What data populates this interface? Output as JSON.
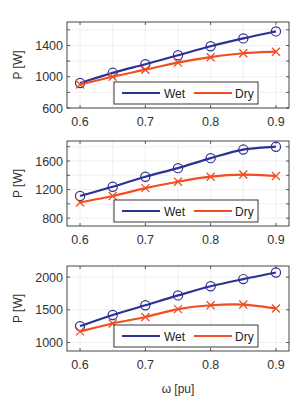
{
  "figure": {
    "xlabel": "ω [pu]",
    "colors": {
      "wet": "#2e3192",
      "dry": "#f04e23",
      "grid": "#e6e6e6",
      "axis": "#333333"
    }
  },
  "chart_data": [
    {
      "type": "line",
      "title": "",
      "xlabel": "",
      "ylabel": "P [W]",
      "x": [
        0.6,
        0.65,
        0.7,
        0.75,
        0.8,
        0.85,
        0.9
      ],
      "xlim": [
        0.58,
        0.92
      ],
      "ylim": [
        600,
        1700
      ],
      "xticks": [
        0.6,
        0.7,
        0.8,
        0.9
      ],
      "xtick_labels": [
        "0.6",
        "0.7",
        "0.8",
        "0.9"
      ],
      "yticks": [
        600,
        1000,
        1400
      ],
      "ytick_labels": [
        "600",
        "1000",
        "1400"
      ],
      "yminor_ticks": [
        800,
        1200,
        1600
      ],
      "grid": true,
      "legend_position": "lower right",
      "series": [
        {
          "name": "Wet",
          "marker": "o",
          "color": "#2e3192",
          "values": [
            920,
            1050,
            1160,
            1275,
            1390,
            1490,
            1580
          ]
        },
        {
          "name": "Dry",
          "marker": "x",
          "color": "#f04e23",
          "values": [
            900,
            1000,
            1090,
            1180,
            1250,
            1300,
            1320
          ]
        }
      ]
    },
    {
      "type": "line",
      "title": "",
      "xlabel": "",
      "ylabel": "P [W]",
      "x": [
        0.6,
        0.65,
        0.7,
        0.75,
        0.8,
        0.85,
        0.9
      ],
      "xlim": [
        0.58,
        0.92
      ],
      "ylim": [
        690,
        1880
      ],
      "xticks": [
        0.6,
        0.7,
        0.8,
        0.9
      ],
      "xtick_labels": [
        "0.6",
        "0.7",
        "0.8",
        "0.9"
      ],
      "yticks": [
        800,
        1200,
        1600
      ],
      "ytick_labels": [
        "800",
        "1200",
        "1600"
      ],
      "yminor_ticks": [
        1000,
        1400,
        1800
      ],
      "grid": true,
      "legend_position": "lower right",
      "series": [
        {
          "name": "Wet",
          "marker": "o",
          "color": "#2e3192",
          "values": [
            1110,
            1240,
            1380,
            1500,
            1640,
            1760,
            1800
          ]
        },
        {
          "name": "Dry",
          "marker": "x",
          "color": "#f04e23",
          "values": [
            1020,
            1110,
            1220,
            1310,
            1380,
            1410,
            1390
          ]
        }
      ]
    },
    {
      "type": "line",
      "title": "",
      "xlabel": "ω [pu]",
      "ylabel": "P [W]",
      "x": [
        0.6,
        0.65,
        0.7,
        0.75,
        0.8,
        0.85,
        0.9
      ],
      "xlim": [
        0.58,
        0.92
      ],
      "ylim": [
        870,
        2170
      ],
      "xticks": [
        0.6,
        0.7,
        0.8,
        0.9
      ],
      "xtick_labels": [
        "0.6",
        "0.7",
        "0.8",
        "0.9"
      ],
      "yticks": [
        1000,
        1500,
        2000
      ],
      "ytick_labels": [
        "1000",
        "1500",
        "2000"
      ],
      "yminor_ticks": [],
      "grid": true,
      "legend_position": "lower right",
      "series": [
        {
          "name": "Wet",
          "marker": "o",
          "color": "#2e3192",
          "values": [
            1250,
            1420,
            1570,
            1720,
            1860,
            1970,
            2070
          ]
        },
        {
          "name": "Dry",
          "marker": "x",
          "color": "#f04e23",
          "values": [
            1170,
            1290,
            1390,
            1510,
            1570,
            1580,
            1520
          ]
        }
      ]
    }
  ],
  "panels": [
    {
      "ylabel": "P [W]",
      "legend": {
        "wet": "Wet",
        "dry": "Dry"
      }
    },
    {
      "ylabel": "P [W]",
      "legend": {
        "wet": "Wet",
        "dry": "Dry"
      }
    },
    {
      "ylabel": "P [W]",
      "legend": {
        "wet": "Wet",
        "dry": "Dry"
      }
    }
  ]
}
